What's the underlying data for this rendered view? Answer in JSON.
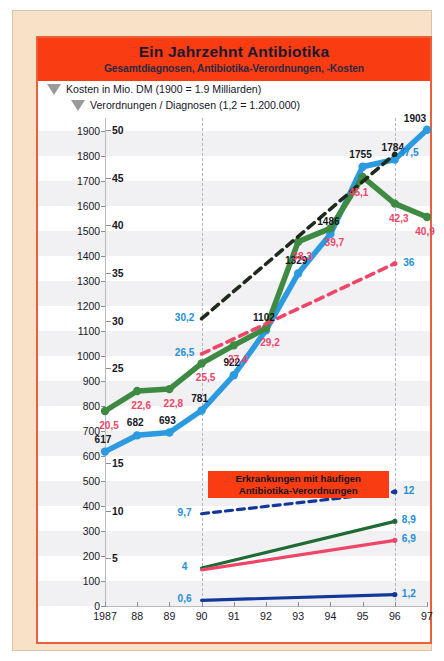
{
  "header": {
    "title": "Ein Jahrzehnt Antibiotika",
    "subtitle": "Gesamtdiagnosen, Antibiotika-Verordnungen, -Kosten",
    "bg_color": "#f93c12"
  },
  "legend": {
    "items": [
      {
        "icon": "triangle-marker",
        "label": "Kosten in Mio. DM (1900 = 1.9 Milliarden)"
      },
      {
        "icon": "triangle-marker",
        "label": "Verordnungen / Diagnosen (1,2 = 1.200.000)"
      }
    ]
  },
  "callout": {
    "line1": "Erkrankungen mit häufigen",
    "line2": "Antibiotika-Verordnungen",
    "bg_color": "#f93c12"
  },
  "colors": {
    "blue": "#2b9ae0",
    "green": "#3f8a42",
    "dark_green": "#1f6b34",
    "red": "#ef4668",
    "pink_dash": "#ef4668",
    "black_dash": "#1d2a1d",
    "navy": "#12399a",
    "frame": "#e8603c",
    "paper": "#f7e2c8"
  },
  "chart_data": {
    "type": "line",
    "title": "Ein Jahrzehnt Antibiotika",
    "subtitle": "Gesamtdiagnosen, Antibiotika-Verordnungen, -Kosten",
    "xlabel": "",
    "ylabel": "",
    "grid": true,
    "legend_position": "top-left",
    "x": [
      "1987",
      "88",
      "89",
      "90",
      "91",
      "92",
      "93",
      "94",
      "95",
      "96",
      "97"
    ],
    "y_axis_left": {
      "ticks": [
        0,
        100,
        200,
        300,
        400,
        500,
        600,
        700,
        800,
        900,
        1000,
        1100,
        1200,
        1300,
        1400,
        1500,
        1600,
        1700,
        1800,
        1900
      ],
      "ylim": [
        0,
        1950
      ],
      "unit": "Mio. DM"
    },
    "y_axis_right": {
      "ticks": [
        5,
        10,
        15,
        20,
        25,
        30,
        35,
        40,
        45,
        50
      ],
      "visible_ticks": [
        5,
        10,
        15,
        25,
        30,
        35,
        40,
        45,
        50
      ],
      "ylim": [
        0,
        51.3
      ],
      "unit": "Mio. Verordnungen / Diagnosen"
    },
    "series": [
      {
        "name": "Kosten in Mio. DM",
        "axis": "left",
        "color": "#2b9ae0",
        "style": "solid",
        "markers": true,
        "x": [
          "1987",
          "88",
          "89",
          "90",
          "91",
          "92",
          "93",
          "94",
          "95",
          "96",
          "97"
        ],
        "values": [
          617,
          682,
          693,
          781,
          922,
          1102,
          1329,
          1486,
          1755,
          1784,
          1903
        ],
        "labels": [
          "617",
          "682",
          "693",
          "781",
          "922",
          "1102",
          "1329",
          "1486",
          "1755",
          "1784",
          "1903"
        ],
        "label_color": "#17171f"
      },
      {
        "name": "Gesamtdiagnosen",
        "axis": "right",
        "color": "#3f8a42",
        "style": "solid",
        "markers": true,
        "x": [
          "1987",
          "88",
          "89",
          "90",
          "91",
          "92",
          "93",
          "94",
          "95",
          "96",
          "97"
        ],
        "values": [
          20.5,
          22.6,
          22.8,
          25.5,
          27.4,
          29.2,
          38.3,
          39.7,
          45.1,
          42.3,
          40.9
        ],
        "labels": [
          "20,5",
          "22,6",
          "22,8",
          "25,5",
          "27,4",
          "29,2",
          "38,3",
          "39,7",
          "45,1",
          "42,3",
          "40,9"
        ],
        "label_color": "#ef4668"
      },
      {
        "name": "Trend gestrichelt schwarz",
        "axis": "right",
        "color": "#1d2a1d",
        "style": "dashed",
        "markers": false,
        "x": [
          "90",
          "96"
        ],
        "values": [
          30.2,
          47.5
        ],
        "labels": [
          "30,2",
          "47,5"
        ],
        "label_color": "#1f8fd6"
      },
      {
        "name": "Trend gestrichelt rot",
        "axis": "right",
        "color": "#ef4668",
        "style": "dashed",
        "markers": false,
        "x": [
          "90",
          "96"
        ],
        "values": [
          26.5,
          36.0
        ],
        "labels": [
          "26,5",
          "36"
        ],
        "label_color": "#1f8fd6"
      },
      {
        "name": "Erkrankung navy gestrichelt",
        "axis": "right",
        "color": "#12399a",
        "style": "dashed",
        "markers": false,
        "x": [
          "90",
          "96"
        ],
        "values": [
          9.7,
          12.0
        ],
        "labels": [
          "9,7",
          "12"
        ],
        "label_color": "#1f8fd6"
      },
      {
        "name": "Erkrankung dunkelgrün",
        "axis": "right",
        "color": "#1f6b34",
        "style": "solid",
        "markers": false,
        "x": [
          "90",
          "96"
        ],
        "values": [
          4.0,
          8.9
        ],
        "labels": [
          "4",
          "8,9"
        ],
        "label_color": "#1f8fd6"
      },
      {
        "name": "Erkrankung rot",
        "axis": "right",
        "color": "#ef4668",
        "style": "solid",
        "markers": false,
        "x": [
          "90",
          "96"
        ],
        "values": [
          3.8,
          6.9
        ],
        "labels": [
          "",
          "6,9"
        ],
        "label_color": "#1f8fd6"
      },
      {
        "name": "Erkrankung navy",
        "axis": "right",
        "color": "#12399a",
        "style": "solid",
        "markers": false,
        "x": [
          "90",
          "96"
        ],
        "values": [
          0.6,
          1.2
        ],
        "labels": [
          "0,6",
          "1,2"
        ],
        "label_color": "#1f8fd6"
      }
    ],
    "annotations": [
      {
        "text": "Erkrankungen mit häufigen Antibiotika-Verordnungen",
        "type": "callout"
      }
    ]
  }
}
